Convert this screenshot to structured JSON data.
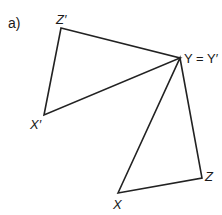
{
  "part_label": "a)",
  "labels": {
    "z_prime": "Z′",
    "y_eq": "Y = Y′",
    "x_prime": "X′",
    "x": "X",
    "z": "Z"
  },
  "points": {
    "Z_prime": [
      61,
      28
    ],
    "Y": [
      180,
      58
    ],
    "X_prime": [
      44,
      115
    ],
    "X": [
      118,
      193
    ],
    "Z": [
      202,
      178
    ]
  },
  "triangles": [
    {
      "name": "X'Y'Z'",
      "vertices": [
        "X_prime",
        "Y",
        "Z_prime"
      ]
    },
    {
      "name": "XYZ",
      "vertices": [
        "X",
        "Y",
        "Z"
      ]
    }
  ],
  "colors": {
    "stroke": "#222222"
  }
}
